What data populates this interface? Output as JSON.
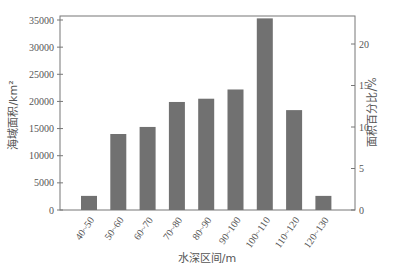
{
  "chart_data": {
    "type": "bar",
    "title": "",
    "xlabel": "水深区间/m",
    "ylabel": "海域面积/km²",
    "ylabel_right": "面积百分比/%",
    "categories": [
      "40~50",
      "50~60",
      "60~70",
      "70~80",
      "80~90",
      "90~100",
      "100~110",
      "110~120",
      "120~130"
    ],
    "values": [
      2600,
      14000,
      15300,
      19900,
      20500,
      22200,
      35300,
      18400,
      2600
    ],
    "ylim": [
      0,
      35000
    ],
    "yticks": [
      0,
      5000,
      10000,
      15000,
      20000,
      25000,
      30000,
      35000
    ],
    "ylim_right": [
      0,
      22.9
    ],
    "yticks_right": [
      0,
      5,
      10,
      15,
      20
    ],
    "grid": false,
    "legend": null,
    "bar_color": "#717171"
  }
}
